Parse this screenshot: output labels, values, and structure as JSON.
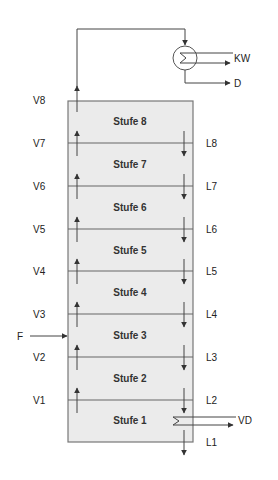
{
  "diagram": {
    "type": "distillation-column",
    "column": {
      "fill_color": "#ebebeb",
      "border_color": "#777777",
      "stages": [
        {
          "label": "Stufe 8"
        },
        {
          "label": "Stufe 7"
        },
        {
          "label": "Stufe 6"
        },
        {
          "label": "Stufe 5"
        },
        {
          "label": "Stufe 4"
        },
        {
          "label": "Stufe 3"
        },
        {
          "label": "Stufe 2"
        },
        {
          "label": "Stufe 1"
        }
      ]
    },
    "vapor_streams": [
      "V8",
      "V7",
      "V6",
      "V5",
      "V4",
      "V3",
      "V2",
      "V1"
    ],
    "liquid_streams": [
      "L8",
      "L7",
      "L6",
      "L5",
      "L4",
      "L3",
      "L2",
      "L1"
    ],
    "feed": {
      "label": "F",
      "stage": "Stufe 3"
    },
    "condenser": {
      "coolant_label": "KW",
      "distillate_label": "D"
    },
    "reboiler": {
      "vapor_outlet_label": "VD"
    }
  }
}
